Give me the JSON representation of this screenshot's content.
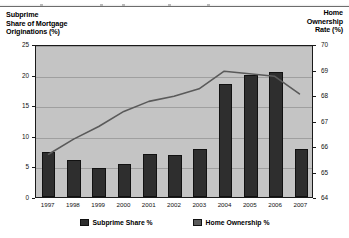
{
  "chart_data": {
    "type": "bar",
    "title": "",
    "subtitle": "",
    "categories": [
      "1997",
      "1998",
      "1999",
      "2000",
      "2001",
      "2002",
      "2003",
      "2004",
      "2005",
      "2006",
      "2007"
    ],
    "series": [
      {
        "name": "Subprime Share %",
        "type": "bar",
        "axis": "left",
        "color": "#2e2e2e",
        "values": [
          7.4,
          6.0,
          4.7,
          5.4,
          7.0,
          6.8,
          7.9,
          18.5,
          20.0,
          20.4,
          7.9
        ]
      },
      {
        "name": "Home Ownership %",
        "type": "line",
        "axis": "right",
        "color": "#5a5a5a",
        "values": [
          65.7,
          66.3,
          66.8,
          67.4,
          67.8,
          68.0,
          68.3,
          69.0,
          68.9,
          68.8,
          68.1
        ]
      }
    ],
    "ylabel": "Subprime Share of Mortgage Originations (%)",
    "ylabel_right": "Home Ownership Rate (%)",
    "xlabel": "",
    "ylim": [
      0,
      25
    ],
    "ylim_right": [
      64,
      70
    ],
    "yticks": [
      0,
      5,
      10,
      15,
      20,
      25
    ],
    "yticks_right": [
      64,
      65,
      66,
      67,
      68,
      69,
      70
    ],
    "grid": true,
    "legend_position": "bottom",
    "plot_background": "#c4c4c4"
  },
  "axes": {
    "left_title": "Subprime\nShare of Mortgage\nOriginations (%)",
    "left_title_lines": [
      "Subprime",
      "Share of Mortgage",
      "Originations (%)"
    ],
    "right_title_lines": [
      "Home",
      "Ownership",
      "Rate (%)"
    ]
  },
  "legend": {
    "items": [
      {
        "label": "Subprime Share %",
        "marker": "bar-swatch"
      },
      {
        "label": "Home Ownership %",
        "marker": "line-swatch"
      }
    ]
  }
}
